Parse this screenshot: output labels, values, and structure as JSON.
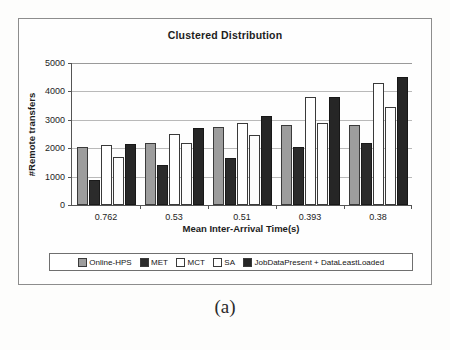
{
  "figure": {
    "caption": "(a)"
  },
  "chart_data": {
    "type": "bar",
    "title": "Clustered Distribution",
    "xlabel": "Mean Inter-Arrival Time(s)",
    "ylabel": "#Remote transfers",
    "categories": [
      "0.762",
      "0.53",
      "0.51",
      "0.393",
      "0.38"
    ],
    "ylim": [
      0,
      5000
    ],
    "yticks": [
      "0",
      "1000",
      "2000",
      "3000",
      "4000",
      "5000"
    ],
    "grid": true,
    "legend_position": "bottom",
    "series": [
      {
        "name": "Online-HPS",
        "color": "#9d9d9d",
        "values": [
          2050,
          2200,
          2750,
          2800,
          2800
        ]
      },
      {
        "name": "MET",
        "color": "#2b2b2b",
        "values": [
          870,
          1400,
          1650,
          2050,
          2200
        ]
      },
      {
        "name": "MCT",
        "color": "#ffffff",
        "values": [
          2100,
          2500,
          2900,
          3800,
          4300
        ]
      },
      {
        "name": "SA",
        "color": "#ffffff",
        "values": [
          1700,
          2200,
          2450,
          2900,
          3450
        ]
      },
      {
        "name": "JobDataPresent + DataLeastLoaded",
        "color": "#262626",
        "values": [
          2150,
          2700,
          3150,
          3800,
          4500
        ]
      }
    ]
  }
}
